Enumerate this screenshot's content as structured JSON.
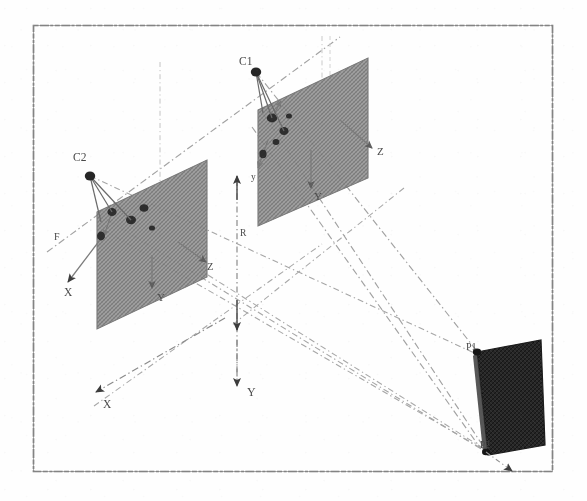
{
  "figure": {
    "border_color": "#6b6b6b",
    "background_color": "#fefefe",
    "plane_fill_color": "#8f8f8f",
    "object_fill_color": "#2b2b2b",
    "ray_color": "#9a9a9a",
    "axis_color": "#8a8a8a",
    "label_color": "#4a4a4a"
  },
  "cameras": [
    {
      "id": "c1",
      "label": "C1",
      "x": 256,
      "y": 72,
      "label_x": 239,
      "label_y": 65
    },
    {
      "id": "c2",
      "label": "C2",
      "x": 90,
      "y": 176,
      "label_x": 73,
      "label_y": 161
    }
  ],
  "image_planes": [
    {
      "id": "plane-right",
      "name": "right-image-plane",
      "points": "258,110 368,58 368,178 258,226",
      "axis_labels": [
        {
          "text": "Z",
          "x": 377,
          "y": 155
        },
        {
          "text": "Y",
          "x": 314,
          "y": 196
        },
        {
          "text": "y",
          "x": 253,
          "y": 178
        }
      ]
    },
    {
      "id": "plane-left",
      "name": "left-image-plane",
      "points": "97,212 207,160 207,277 97,329",
      "axis_labels": [
        {
          "text": "Z",
          "x": 207,
          "y": 268
        },
        {
          "text": "Y",
          "x": 157,
          "y": 299
        },
        {
          "text": "X",
          "x": 69,
          "y": 294
        },
        {
          "text": "F",
          "x": 57,
          "y": 238
        }
      ]
    }
  ],
  "world_axes": [
    {
      "text": "X",
      "x": 105,
      "y": 405
    },
    {
      "text": "Y",
      "x": 243,
      "y": 396
    }
  ],
  "measurements": [
    {
      "id": "baseline-height",
      "text": "R",
      "x": 240,
      "y": 234
    }
  ],
  "object": {
    "id": "scene-object",
    "name": "3d-scene-object",
    "points": "477,352 541,340 545,445 488,455",
    "labels": [
      {
        "text": "P1",
        "x": 469,
        "y": 348
      },
      {
        "text": "P2",
        "x": 482,
        "y": 445
      }
    ]
  },
  "ray_bundles": {
    "from_c1_label": "projection rays from C1",
    "from_c2_label": "projection rays from C2"
  }
}
